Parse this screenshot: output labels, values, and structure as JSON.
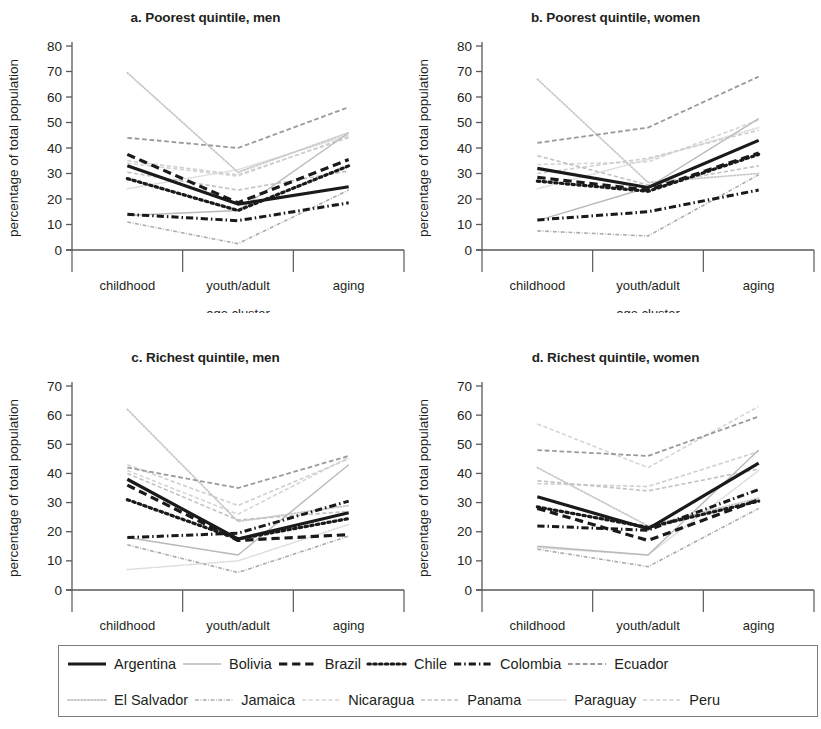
{
  "figure": {
    "axis_x_title": "age cluster",
    "axis_y_title": "percentage of total population",
    "categories": [
      "childhood",
      "youth/adult",
      "aging"
    ]
  },
  "panels": [
    {
      "id": "a",
      "title": "a. Poorest quintile, men",
      "ylim": [
        0,
        80
      ],
      "yticks": [
        "0",
        "10",
        "20",
        "30",
        "40",
        "50",
        "60",
        "70",
        "80"
      ]
    },
    {
      "id": "b",
      "title": "b. Poorest quintile, women",
      "ylim": [
        0,
        80
      ],
      "yticks": [
        "0",
        "10",
        "20",
        "30",
        "40",
        "50",
        "60",
        "70",
        "80"
      ]
    },
    {
      "id": "c",
      "title": "c. Richest quintile, men",
      "ylim": [
        0,
        70
      ],
      "yticks": [
        "0",
        "10",
        "20",
        "30",
        "40",
        "50",
        "60",
        "70"
      ]
    },
    {
      "id": "d",
      "title": "d. Richest quintile, women",
      "ylim": [
        0,
        70
      ],
      "yticks": [
        "0",
        "10",
        "20",
        "30",
        "40",
        "50",
        "60",
        "70"
      ]
    }
  ],
  "legend": {
    "rows": [
      [
        {
          "name": "Argentina",
          "style": "solid",
          "color": "#1a1a1a",
          "width": 3.2
        },
        {
          "name": "Bolivia",
          "style": "solid",
          "color": "#b9b9b9",
          "width": 1.4
        },
        {
          "name": "Brazil",
          "style": "dashed",
          "color": "#1a1a1a",
          "width": 3.2
        },
        {
          "name": "Chile",
          "style": "dotted",
          "color": "#1a1a1a",
          "width": 3.2
        },
        {
          "name": "Colombia",
          "style": "dashdot",
          "color": "#1a1a1a",
          "width": 3.0
        },
        {
          "name": "Ecuador",
          "style": "dashed",
          "color": "#9a9a9a",
          "width": 1.8
        }
      ],
      [
        {
          "name": "El Salvador",
          "style": "dotted",
          "color": "#c9c9c9",
          "width": 1.8
        },
        {
          "name": "Jamaica",
          "style": "dashdot",
          "color": "#ababab",
          "width": 1.6
        },
        {
          "name": "Nicaragua",
          "style": "dashed",
          "color": "#d5d5d5",
          "width": 1.6
        },
        {
          "name": "Panama",
          "style": "dashed",
          "color": "#c2c2c2",
          "width": 1.6
        },
        {
          "name": "Paraguay",
          "style": "dotted",
          "color": "#dcdcdc",
          "width": 1.6
        },
        {
          "name": "Peru",
          "style": "dashed",
          "color": "#cfcfcf",
          "width": 1.6
        }
      ]
    ]
  },
  "chart_data": [
    {
      "type": "line",
      "panel": "a",
      "title": "a. Poorest quintile, men",
      "xlabel": "age cluster",
      "ylabel": "percentage of total population",
      "categories": [
        "childhood",
        "youth/adult",
        "aging"
      ],
      "ylim": [
        0,
        80
      ],
      "yticks": [
        0,
        10,
        20,
        30,
        40,
        50,
        60,
        70,
        80
      ],
      "grid": false,
      "legend_position": "bottom",
      "series": [
        {
          "name": "Argentina",
          "values": [
            33.0,
            18.0,
            24.8
          ]
        },
        {
          "name": "Bolivia",
          "values": [
            13.5,
            15.5,
            46.0
          ]
        },
        {
          "name": "Brazil",
          "values": [
            37.5,
            18.5,
            35.5
          ]
        },
        {
          "name": "Chile",
          "values": [
            28.0,
            15.5,
            33.0
          ]
        },
        {
          "name": "Colombia",
          "values": [
            14.0,
            11.5,
            18.5
          ]
        },
        {
          "name": "Ecuador",
          "values": [
            44.0,
            40.0,
            56.0
          ]
        },
        {
          "name": "El Salvador",
          "values": [
            69.5,
            30.5,
            46.0
          ]
        },
        {
          "name": "Jamaica",
          "values": [
            11.0,
            2.5,
            23.5
          ]
        },
        {
          "name": "Nicaragua",
          "values": [
            34.0,
            29.0,
            44.5
          ]
        },
        {
          "name": "Panama",
          "values": [
            30.5,
            23.5,
            31.0
          ]
        },
        {
          "name": "Paraguay",
          "values": [
            24.0,
            31.5,
            45.0
          ]
        },
        {
          "name": "Peru",
          "values": [
            35.0,
            29.5,
            44.0
          ]
        }
      ]
    },
    {
      "type": "line",
      "panel": "b",
      "title": "b. Poorest quintile, women",
      "xlabel": "age cluster",
      "ylabel": "percentage of total population",
      "categories": [
        "childhood",
        "youth/adult",
        "aging"
      ],
      "ylim": [
        0,
        80
      ],
      "yticks": [
        0,
        10,
        20,
        30,
        40,
        50,
        60,
        70,
        80
      ],
      "grid": false,
      "legend_position": "bottom",
      "series": [
        {
          "name": "Argentina",
          "values": [
            32.0,
            24.5,
            43.0
          ]
        },
        {
          "name": "Bolivia",
          "values": [
            11.5,
            24.5,
            51.5
          ]
        },
        {
          "name": "Brazil",
          "values": [
            28.5,
            23.5,
            38.0
          ]
        },
        {
          "name": "Chile",
          "values": [
            27.0,
            23.0,
            37.5
          ]
        },
        {
          "name": "Colombia",
          "values": [
            11.8,
            15.0,
            23.5
          ]
        },
        {
          "name": "Ecuador",
          "values": [
            42.0,
            48.0,
            68.0
          ]
        },
        {
          "name": "El Salvador",
          "values": [
            67.0,
            26.5,
            30.0
          ]
        },
        {
          "name": "Jamaica",
          "values": [
            7.5,
            5.5,
            29.5
          ]
        },
        {
          "name": "Nicaragua",
          "values": [
            33.5,
            34.5,
            51.0
          ]
        },
        {
          "name": "Panama",
          "values": [
            37.0,
            25.5,
            33.0
          ]
        },
        {
          "name": "Paraguay",
          "values": [
            24.0,
            35.5,
            48.0
          ]
        },
        {
          "name": "Peru",
          "values": [
            30.0,
            36.0,
            47.0
          ]
        }
      ]
    },
    {
      "type": "line",
      "panel": "c",
      "title": "c. Richest quintile, men",
      "xlabel": "age cluster",
      "ylabel": "percentage of total population",
      "categories": [
        "childhood",
        "youth/adult",
        "aging"
      ],
      "ylim": [
        0,
        70
      ],
      "yticks": [
        0,
        10,
        20,
        30,
        40,
        50,
        60,
        70
      ],
      "grid": false,
      "legend_position": "bottom",
      "series": [
        {
          "name": "Argentina",
          "values": [
            38.0,
            17.5,
            26.5
          ]
        },
        {
          "name": "Bolivia",
          "values": [
            18.0,
            12.0,
            43.0
          ]
        },
        {
          "name": "Brazil",
          "values": [
            36.0,
            17.0,
            19.0
          ]
        },
        {
          "name": "Chile",
          "values": [
            31.0,
            17.5,
            24.5
          ]
        },
        {
          "name": "Colombia",
          "values": [
            18.0,
            19.5,
            30.5
          ]
        },
        {
          "name": "Ecuador",
          "values": [
            42.0,
            35.0,
            46.0
          ]
        },
        {
          "name": "El Salvador",
          "values": [
            62.0,
            23.5,
            29.0
          ]
        },
        {
          "name": "Jamaica",
          "values": [
            15.5,
            6.0,
            18.5
          ]
        },
        {
          "name": "Nicaragua",
          "values": [
            41.0,
            26.0,
            45.5
          ]
        },
        {
          "name": "Panama",
          "values": [
            40.0,
            24.0,
            27.0
          ]
        },
        {
          "name": "Paraguay",
          "values": [
            7.0,
            10.0,
            22.5
          ]
        },
        {
          "name": "Peru",
          "values": [
            43.0,
            29.0,
            45.0
          ]
        }
      ]
    },
    {
      "type": "line",
      "panel": "d",
      "title": "d. Richest quintile, women",
      "xlabel": "age cluster",
      "ylabel": "percentage of total population",
      "categories": [
        "childhood",
        "youth/adult",
        "aging"
      ],
      "ylim": [
        0,
        70
      ],
      "yticks": [
        0,
        10,
        20,
        30,
        40,
        50,
        60,
        70
      ],
      "grid": false,
      "legend_position": "bottom",
      "series": [
        {
          "name": "Argentina",
          "values": [
            32.0,
            21.0,
            43.5
          ]
        },
        {
          "name": "Bolivia",
          "values": [
            15.0,
            12.0,
            48.0
          ]
        },
        {
          "name": "Brazil",
          "values": [
            28.0,
            17.0,
            31.0
          ]
        },
        {
          "name": "Chile",
          "values": [
            28.5,
            21.5,
            30.5
          ]
        },
        {
          "name": "Colombia",
          "values": [
            22.0,
            20.5,
            34.5
          ]
        },
        {
          "name": "Ecuador",
          "values": [
            48.0,
            46.0,
            59.5
          ]
        },
        {
          "name": "El Salvador",
          "values": [
            42.0,
            22.0,
            31.5
          ]
        },
        {
          "name": "Jamaica",
          "values": [
            14.0,
            8.0,
            28.0
          ]
        },
        {
          "name": "Nicaragua",
          "values": [
            57.0,
            42.0,
            63.0
          ]
        },
        {
          "name": "Panama",
          "values": [
            37.5,
            34.0,
            41.5
          ]
        },
        {
          "name": "Paraguay",
          "values": [
            14.5,
            12.0,
            41.0
          ]
        },
        {
          "name": "Peru",
          "values": [
            36.5,
            35.5,
            47.5
          ]
        }
      ]
    }
  ]
}
